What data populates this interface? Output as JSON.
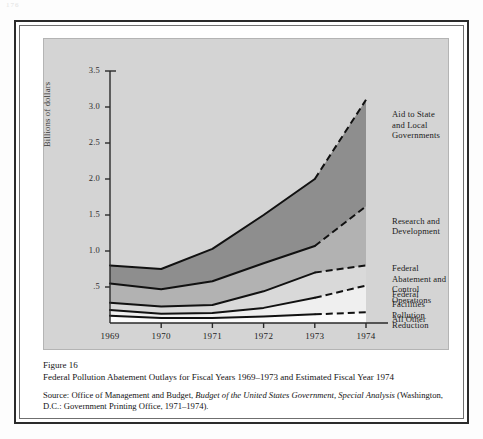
{
  "folio": "176",
  "figure": {
    "number_label": "Figure 16",
    "title": "Federal Pollution Abatement Outlays for Fiscal Years 1969–1973 and Estimated Fiscal Year 1974",
    "source_prefix": "Source:  Office of Management and Budget, ",
    "source_italic_1": "Budget of the United States Government, Special",
    "source_italic_2": "Analysis",
    "source_tail": " (Washington, D.C.:  Government Printing Office, 1971–1974)."
  },
  "chart_data": {
    "type": "area",
    "title": "Federal Pollution Abatement Outlays for Fiscal Years 1969–1973 and Estimated Fiscal Year 1974",
    "xlabel": "",
    "ylabel": "Billions of dollars",
    "x": [
      "1969",
      "1970",
      "1971",
      "1972",
      "1973",
      "1974"
    ],
    "ytick_labels": [
      ".5",
      "1.0",
      "1.5",
      "2.0",
      "2.5",
      "3.0",
      "3.5"
    ],
    "ytick_values": [
      0.5,
      1.0,
      1.5,
      2.0,
      2.5,
      3.0,
      3.5
    ],
    "ylim": [
      0,
      3.5
    ],
    "grid": false,
    "legend_position": "right-inline",
    "stacked": true,
    "estimated_from": "1973",
    "estimated_note": "1973–1974 segment drawn dashed (estimated)",
    "series": [
      {
        "name": "All Other",
        "label": "All Other",
        "values": [
          0.1,
          0.07,
          0.07,
          0.09,
          0.12,
          0.15
        ],
        "fill": "#fbfbfb"
      },
      {
        "name": "Federal Facilities Pollution Reduction",
        "label": "Federal Facilities\nPollution Reduction",
        "values": [
          0.08,
          0.06,
          0.07,
          0.12,
          0.23,
          0.37
        ],
        "fill": "#efefef"
      },
      {
        "name": "Federal Abatement and Control Operations",
        "label": "Federal Abatement and\nControl Operations",
        "values": [
          0.1,
          0.1,
          0.11,
          0.23,
          0.35,
          0.28
        ],
        "fill": "#d9d9d9"
      },
      {
        "name": "Research and Development",
        "label": "Research and\nDevelopment",
        "values": [
          0.27,
          0.24,
          0.33,
          0.39,
          0.37,
          0.82
        ],
        "fill": "#b2b2b2"
      },
      {
        "name": "Aid to State and Local Governments",
        "label": "Aid to State and Local\nGovernments",
        "values": [
          0.25,
          0.28,
          0.45,
          0.67,
          0.93,
          1.48
        ],
        "fill": "#8e8e8e"
      }
    ],
    "cumulative_tops": {
      "all_other": [
        0.1,
        0.07,
        0.07,
        0.09,
        0.12,
        0.15
      ],
      "federal_facilities": [
        0.18,
        0.13,
        0.14,
        0.21,
        0.35,
        0.52
      ],
      "federal_abatement": [
        0.28,
        0.23,
        0.25,
        0.44,
        0.7,
        0.8
      ],
      "research_development": [
        0.55,
        0.47,
        0.58,
        0.83,
        1.07,
        1.62
      ],
      "total": [
        0.8,
        0.75,
        1.03,
        1.5,
        2.0,
        3.1
      ]
    }
  }
}
